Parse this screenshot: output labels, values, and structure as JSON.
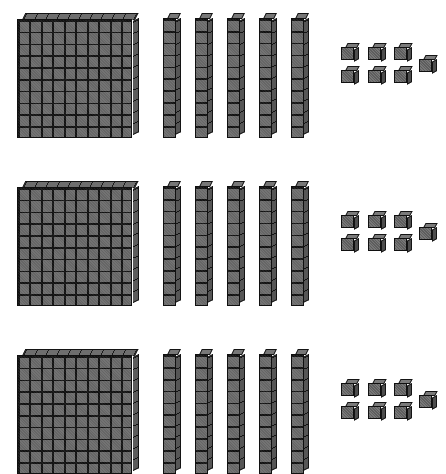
{
  "image": {
    "title": "Base-ten blocks",
    "description": "Three identical groups of base-ten blocks on a white background",
    "background_color": "#ffffff",
    "block_color": "#6b6b6b",
    "block_outline_color": "#131313",
    "block_shadow_color": "#4d4d4d",
    "width": 446,
    "height": 474
  },
  "manipulative": {
    "type": "base-ten-blocks",
    "place_values": [
      {
        "name": "flat",
        "label": "hundreds",
        "unit_value": 100,
        "grid": "10x10"
      },
      {
        "name": "rod",
        "label": "tens",
        "unit_value": 10,
        "grid": "1x10"
      },
      {
        "name": "unit",
        "label": "ones",
        "unit_value": 1,
        "grid": "1x1"
      }
    ],
    "rows": [
      {
        "row_label": "row-1",
        "flats": 1,
        "rods": 5,
        "units": 7,
        "hundreds_value": 100,
        "tens_value": 50,
        "ones_value": 7,
        "row_total": 157
      },
      {
        "row_label": "row-2",
        "flats": 1,
        "rods": 5,
        "units": 7,
        "hundreds_value": 100,
        "tens_value": 50,
        "ones_value": 7,
        "row_total": 157
      },
      {
        "row_label": "row-3",
        "flats": 1,
        "rods": 5,
        "units": 7,
        "hundreds_value": 100,
        "tens_value": 50,
        "ones_value": 7,
        "row_total": 157
      }
    ],
    "grand_total": 471,
    "total_flats": 3,
    "total_rods": 15,
    "total_units": 21
  },
  "layout": {
    "row_tops": [
      13,
      181,
      349
    ],
    "flat_left": 17,
    "rod_lefts": [
      163,
      195,
      227,
      259,
      291
    ],
    "unit_cells": [
      {
        "left": 341,
        "top": 30
      },
      {
        "left": 368,
        "top": 30
      },
      {
        "left": 394,
        "top": 30
      },
      {
        "left": 341,
        "top": 53
      },
      {
        "left": 368,
        "top": 53
      },
      {
        "left": 394,
        "top": 53
      },
      {
        "left": 419,
        "top": 42
      }
    ]
  }
}
